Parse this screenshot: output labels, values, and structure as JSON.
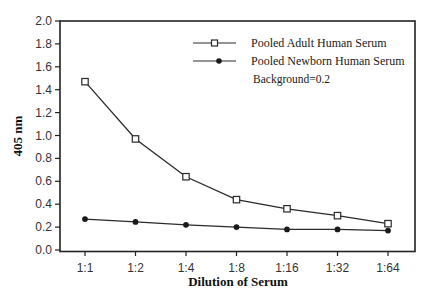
{
  "chart_data": {
    "type": "line",
    "title": "",
    "xlabel": "Dilution of Serum",
    "ylabel": "405 nm",
    "categories": [
      "1:1",
      "1:2",
      "1:4",
      "1:8",
      "1:16",
      "1:32",
      "1:64"
    ],
    "ylim": [
      0.0,
      2.0
    ],
    "yticks": [
      "0.0",
      "0.2",
      "0.4",
      "0.6",
      "0.8",
      "1.0",
      "1.2",
      "1.4",
      "1.6",
      "1.8",
      "2.0"
    ],
    "grid": false,
    "legend_position": "upper right (inside)",
    "series": [
      {
        "name": "Pooled Adult Human Serum",
        "marker": "open-square",
        "values": [
          1.47,
          0.97,
          0.64,
          0.44,
          0.36,
          0.3,
          0.23
        ]
      },
      {
        "name": "Pooled Newborn Human Serum",
        "marker": "filled-circle",
        "values": [
          0.27,
          0.245,
          0.22,
          0.2,
          0.18,
          0.18,
          0.17
        ]
      }
    ],
    "annotations": [
      "Background=0.2"
    ]
  },
  "colors": {
    "line": "#2a2a2a",
    "axis": "#222222",
    "background": "#ffffff"
  }
}
